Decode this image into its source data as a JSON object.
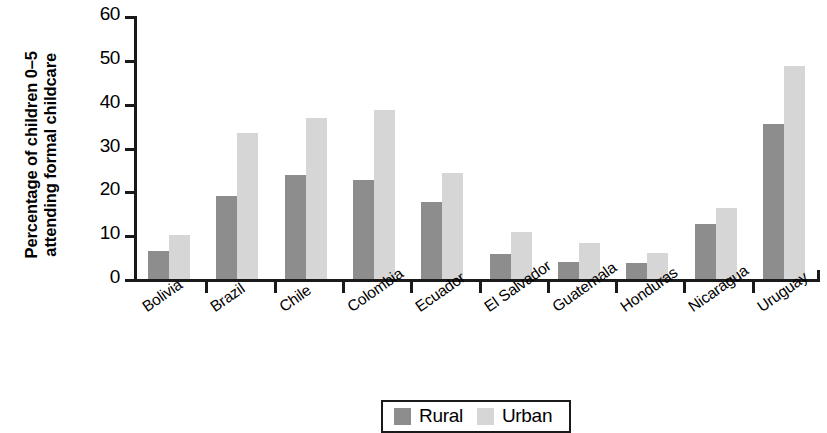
{
  "chart_data": {
    "type": "bar",
    "title": "",
    "xlabel": "",
    "ylabel": "Percentage of children 0–5\nattending formal childcare",
    "ylim": [
      0,
      60
    ],
    "yticks": [
      0,
      10,
      20,
      30,
      40,
      50,
      60
    ],
    "grid": false,
    "legend_position": "bottom-center",
    "categories": [
      "Bolivia",
      "Brazil",
      "Chile",
      "Colombia",
      "Ecuador",
      "El Salvador",
      "Guatemala",
      "Honduras",
      "Nicaragua",
      "Uruguay"
    ],
    "series": [
      {
        "name": "Rural",
        "color": "#8d8d8d",
        "values": [
          6.3,
          19.0,
          23.7,
          22.6,
          17.5,
          5.7,
          3.9,
          3.6,
          12.6,
          35.4
        ]
      },
      {
        "name": "Urban",
        "color": "#d6d6d6",
        "values": [
          10.0,
          33.2,
          36.7,
          38.6,
          24.2,
          10.8,
          8.2,
          6.0,
          16.1,
          48.6
        ]
      }
    ]
  }
}
